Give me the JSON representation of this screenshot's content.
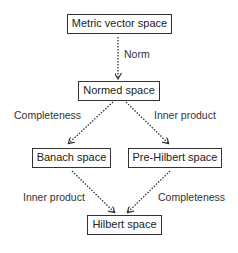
{
  "diagram": {
    "type": "hierarchy",
    "nodes": [
      {
        "id": "metric",
        "label": "Metric vector space"
      },
      {
        "id": "normed",
        "label": "Normed space"
      },
      {
        "id": "banach",
        "label": "Banach space"
      },
      {
        "id": "prehilbert",
        "label": "Pre-Hilbert space"
      },
      {
        "id": "hilbert",
        "label": "Hilbert space"
      }
    ],
    "edges": [
      {
        "from": "metric",
        "to": "normed",
        "label": "Norm",
        "style": "dotted"
      },
      {
        "from": "normed",
        "to": "banach",
        "label": "Completeness",
        "style": "dotted"
      },
      {
        "from": "normed",
        "to": "prehilbert",
        "label": "Inner product",
        "style": "dotted"
      },
      {
        "from": "banach",
        "to": "hilbert",
        "label": "Inner product",
        "style": "dotted"
      },
      {
        "from": "prehilbert",
        "to": "hilbert",
        "label": "Completeness",
        "style": "dotted"
      }
    ]
  },
  "colors": {
    "stroke": "#333333",
    "text": "#222222",
    "background": "#ffffff"
  }
}
